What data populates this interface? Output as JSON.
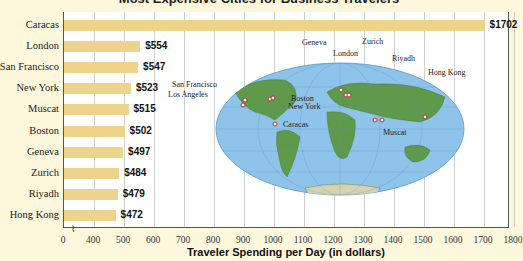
{
  "chart_data": {
    "type": "bar",
    "orientation": "horizontal",
    "title": "Most Expensive Cities for Business Travelers",
    "xlabel": "Traveler Spending per Day (in dollars)",
    "ylabel": "",
    "categories": [
      "Caracas",
      "London",
      "San Francisco",
      "New York",
      "Muscat",
      "Boston",
      "Geneva",
      "Zurich",
      "Riyadh",
      "Hong Kong"
    ],
    "values": [
      1702,
      554,
      547,
      523,
      515,
      502,
      497,
      484,
      479,
      472
    ],
    "value_labels": [
      "$1702",
      "$554",
      "$547",
      "$523",
      "$515",
      "$502",
      "$497",
      "$484",
      "$479",
      "$472"
    ],
    "x_ticks": [
      "0",
      "400",
      "500",
      "600",
      "700",
      "800",
      "900",
      "1000",
      "1100",
      "1200",
      "1300",
      "1400",
      "1500",
      "1600",
      "1700",
      "1800"
    ],
    "xlim": [
      0,
      1800
    ],
    "axis_break": "between 0 and 400",
    "grid": true,
    "bar_color": "#eed48a",
    "inset_map": {
      "labels": [
        "San Francisco",
        "Los Angeles",
        "Boston",
        "New York",
        "Caracas",
        "Geneva",
        "London",
        "Zurich",
        "Riyadh",
        "Muscat",
        "Hong Kong"
      ]
    }
  }
}
